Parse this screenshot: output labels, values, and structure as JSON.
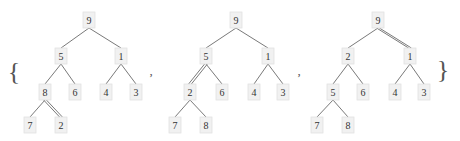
{
  "set": {
    "open_brace": "{",
    "close_brace": "}",
    "separator": ","
  },
  "style": {
    "node_fill": "#f1f1f1",
    "node_stroke": "#e2e2e2",
    "edge_color": "#6a6a6a",
    "text_color": "#333333"
  },
  "trees": [
    {
      "nodes": [
        {
          "id": "a",
          "label": "9",
          "x": 89,
          "y": 20
        },
        {
          "id": "b",
          "label": "5",
          "x": 61,
          "y": 56
        },
        {
          "id": "c",
          "label": "1",
          "x": 121,
          "y": 56
        },
        {
          "id": "d",
          "label": "8",
          "x": 45,
          "y": 92
        },
        {
          "id": "e",
          "label": "6",
          "x": 75,
          "y": 92
        },
        {
          "id": "f",
          "label": "4",
          "x": 106,
          "y": 92
        },
        {
          "id": "g",
          "label": "3",
          "x": 136,
          "y": 92
        },
        {
          "id": "h",
          "label": "7",
          "x": 30,
          "y": 125
        },
        {
          "id": "i",
          "label": "2",
          "x": 61,
          "y": 125
        }
      ],
      "edges": [
        {
          "from": "a",
          "to": "b",
          "double": false
        },
        {
          "from": "a",
          "to": "c",
          "double": false
        },
        {
          "from": "b",
          "to": "d",
          "double": false
        },
        {
          "from": "b",
          "to": "e",
          "double": false
        },
        {
          "from": "c",
          "to": "f",
          "double": false
        },
        {
          "from": "c",
          "to": "g",
          "double": false
        },
        {
          "from": "d",
          "to": "h",
          "double": false
        },
        {
          "from": "d",
          "to": "i",
          "double": true
        }
      ]
    },
    {
      "nodes": [
        {
          "id": "a",
          "label": "9",
          "x": 236,
          "y": 20
        },
        {
          "id": "b",
          "label": "5",
          "x": 206,
          "y": 56
        },
        {
          "id": "c",
          "label": "1",
          "x": 268,
          "y": 56
        },
        {
          "id": "d",
          "label": "2",
          "x": 190,
          "y": 92
        },
        {
          "id": "e",
          "label": "6",
          "x": 222,
          "y": 92
        },
        {
          "id": "f",
          "label": "4",
          "x": 254,
          "y": 92
        },
        {
          "id": "g",
          "label": "3",
          "x": 283,
          "y": 92
        },
        {
          "id": "h",
          "label": "7",
          "x": 175,
          "y": 125
        },
        {
          "id": "i",
          "label": "8",
          "x": 206,
          "y": 125
        }
      ],
      "edges": [
        {
          "from": "a",
          "to": "b",
          "double": false
        },
        {
          "from": "a",
          "to": "c",
          "double": false
        },
        {
          "from": "b",
          "to": "d",
          "double": true
        },
        {
          "from": "b",
          "to": "e",
          "double": false
        },
        {
          "from": "c",
          "to": "f",
          "double": false
        },
        {
          "from": "c",
          "to": "g",
          "double": false
        },
        {
          "from": "d",
          "to": "h",
          "double": false
        },
        {
          "from": "d",
          "to": "i",
          "double": false
        }
      ]
    },
    {
      "nodes": [
        {
          "id": "a",
          "label": "9",
          "x": 378,
          "y": 20
        },
        {
          "id": "b",
          "label": "2",
          "x": 348,
          "y": 56
        },
        {
          "id": "c",
          "label": "1",
          "x": 410,
          "y": 56
        },
        {
          "id": "d",
          "label": "5",
          "x": 333,
          "y": 92
        },
        {
          "id": "e",
          "label": "6",
          "x": 363,
          "y": 92
        },
        {
          "id": "f",
          "label": "4",
          "x": 395,
          "y": 92
        },
        {
          "id": "g",
          "label": "3",
          "x": 424,
          "y": 92
        },
        {
          "id": "h",
          "label": "7",
          "x": 317,
          "y": 125
        },
        {
          "id": "i",
          "label": "8",
          "x": 348,
          "y": 125
        }
      ],
      "edges": [
        {
          "from": "a",
          "to": "b",
          "double": false
        },
        {
          "from": "a",
          "to": "c",
          "double": true
        },
        {
          "from": "b",
          "to": "d",
          "double": false
        },
        {
          "from": "b",
          "to": "e",
          "double": false
        },
        {
          "from": "c",
          "to": "f",
          "double": false
        },
        {
          "from": "c",
          "to": "g",
          "double": false
        },
        {
          "from": "d",
          "to": "h",
          "double": false
        },
        {
          "from": "d",
          "to": "i",
          "double": false
        }
      ]
    }
  ]
}
